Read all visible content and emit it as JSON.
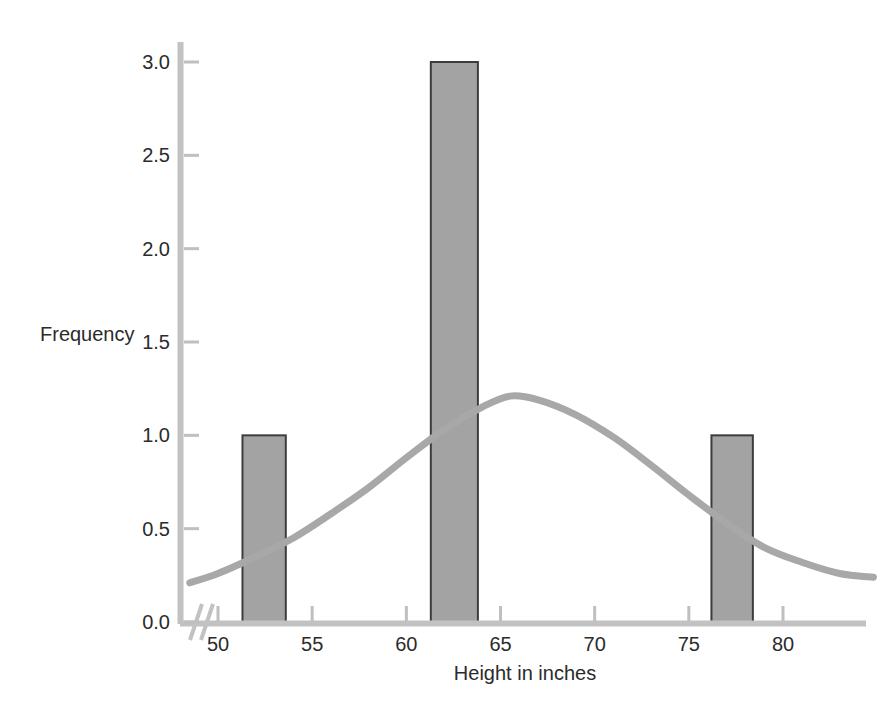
{
  "chart_data": {
    "type": "bar",
    "title": "",
    "subtitle": "",
    "xlabel": "Height in inches",
    "ylabel": "Frequency",
    "xlim": [
      48.5,
      84.8
    ],
    "ylim": [
      0.0,
      3.1
    ],
    "grid": false,
    "legend": "none",
    "axis_break": true,
    "axis_break_note": "broken x-axis slash between origin and 50",
    "xticks": [
      50,
      55,
      60,
      65,
      70,
      75,
      80
    ],
    "xtick_labels": [
      "50",
      "55",
      "60",
      "65",
      "70",
      "75",
      "80"
    ],
    "yticks": [
      0.0,
      0.5,
      1.0,
      1.5,
      2.0,
      2.5,
      3.0
    ],
    "ytick_labels": [
      "0.0",
      "0.5",
      "1.0",
      "1.5",
      "2.0",
      "2.5",
      "3.0"
    ],
    "categories": [
      "51.3-53.6",
      "61.3-63.8",
      "76.2-78.4"
    ],
    "values": [
      1.0,
      3.0,
      1.0
    ],
    "bars": [
      {
        "label": "51.3-53.6",
        "x_start": 51.3,
        "x_end": 53.6,
        "value": 1.0
      },
      {
        "label": "61.3-63.8",
        "x_start": 61.3,
        "x_end": 63.8,
        "value": 3.0
      },
      {
        "label": "76.2-78.4",
        "x_start": 76.2,
        "x_end": 78.4,
        "value": 1.0
      }
    ],
    "series": [
      {
        "name": "normal curve",
        "type": "line",
        "mean": 65.5,
        "peak_value": 1.21,
        "std": 9.0,
        "x": [
          48.5,
          50,
          52,
          54,
          56,
          58,
          60,
          62,
          64,
          65.5,
          67,
          69,
          71,
          73,
          75,
          77,
          79,
          81,
          83,
          84.8
        ],
        "y": [
          0.21,
          0.26,
          0.35,
          0.45,
          0.58,
          0.72,
          0.88,
          1.03,
          1.15,
          1.21,
          1.19,
          1.11,
          0.99,
          0.84,
          0.68,
          0.53,
          0.4,
          0.32,
          0.26,
          0.24
        ]
      }
    ],
    "colors": {
      "bar_fill": "#a3a3a3",
      "bar_stroke": "#3d3d3d",
      "curve": "#a8a8a8",
      "axis": "#bfbfbf",
      "text": "#2b2b2b",
      "background": "#ffffff"
    }
  },
  "labels": {
    "y_axis_title": "Frequency",
    "x_axis_title": "Height in inches"
  }
}
